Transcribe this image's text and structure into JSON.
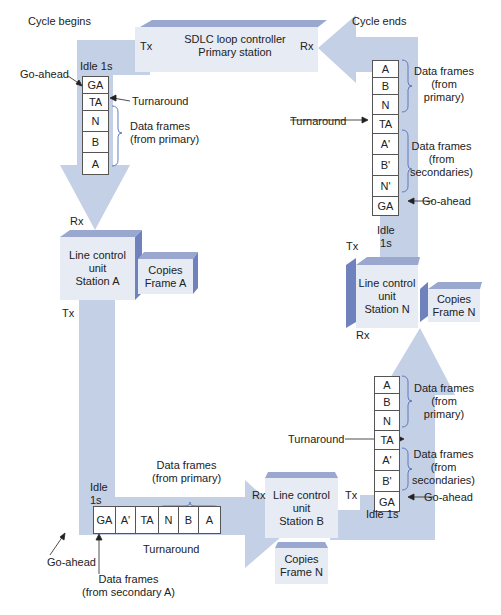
{
  "diagram": {
    "colors": {
      "pipe": "#c4d0e6",
      "pipe_dark": "#8a9cc8",
      "box_front": "#e6ebf4",
      "box_top": "#9aa8cf",
      "box_side": "#6f82bd",
      "frame_border": "#555555",
      "arrow_line": "#222222"
    },
    "controller": {
      "title_line1": "SDLC loop controller",
      "title_line2": "Primary station",
      "tx": "Tx",
      "rx": "Rx"
    },
    "cycle_begins": "Cycle begins",
    "cycle_ends": "Cycle ends",
    "left_top": {
      "idle": "Idle 1s",
      "frames": [
        "GA",
        "TA",
        "N",
        "B",
        "A"
      ],
      "go_ahead": "Go-ahead",
      "turnaround": "Turnaround",
      "data_frames": "Data frames\n(from primary)",
      "rx": "Rx"
    },
    "station_a": {
      "name": "Line control\nunit\nStation A",
      "copies": "Copies\nFrame A",
      "tx": "Tx"
    },
    "bottom": {
      "idle": "Idle\n1s",
      "frames": [
        "GA",
        "A'",
        "TA",
        "N",
        "B",
        "A"
      ],
      "data_frames_primary": "Data frames\n(from primary)",
      "go_ahead": "Go-ahead",
      "turnaround": "Turnaround",
      "data_frames_secondary": "Data frames\n(from secondary A)",
      "rx": "Rx"
    },
    "station_b": {
      "name": "Line control\nunit\nStation B",
      "copies": "Copies\nFrame N",
      "tx": "Tx"
    },
    "right_bottom": {
      "idle": "Idle 1s",
      "frames": [
        "A",
        "B",
        "N",
        "TA",
        "A'",
        "B'",
        "GA"
      ],
      "data_frames_primary": "Data frames\n(from\nprimary)",
      "turnaround": "Turnaround",
      "data_frames_secondaries": "Data frames\n(from\nsecondaries)",
      "go_ahead": "Go-ahead"
    },
    "station_n": {
      "name": "Line control\nunit\nStation N",
      "copies": "Copies\nFrame N",
      "tx": "Tx",
      "rx": "Rx"
    },
    "right_top": {
      "idle": "Idle\n1s",
      "frames": [
        "A",
        "B",
        "N",
        "TA",
        "A'",
        "B'",
        "N'",
        "GA"
      ],
      "data_frames_primary": "Data frames\n(from\nprimary)",
      "turnaround": "Turnaround",
      "data_frames_secondaries": "Data frames\n(from\nsecondaries)",
      "go_ahead": "Go-ahead"
    }
  }
}
